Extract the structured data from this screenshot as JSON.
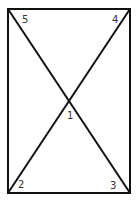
{
  "diagram": {
    "type": "rectangle-with-diagonals",
    "rect": {
      "x1": 8,
      "y1": 9,
      "x2": 130,
      "y2": 193
    },
    "stroke_color": "#111111",
    "labels": [
      {
        "id": "1",
        "text": "1",
        "x": 67,
        "y": 111
      },
      {
        "id": "2",
        "text": "2",
        "x": 18,
        "y": 180
      },
      {
        "id": "3",
        "text": "3",
        "x": 110,
        "y": 181
      },
      {
        "id": "4",
        "text": "4",
        "x": 112,
        "y": 15
      },
      {
        "id": "5",
        "text": "5",
        "x": 22,
        "y": 15
      }
    ]
  }
}
